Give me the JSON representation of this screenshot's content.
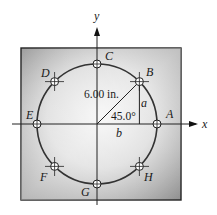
{
  "diagram": {
    "type": "bolt-circle plate",
    "axes": {
      "x_label": "x",
      "y_label": "y"
    },
    "radius_label": "6.00 in.",
    "angle_label": "45.0°",
    "leg_labels": {
      "vertical": "a",
      "horizontal": "b"
    },
    "holes": [
      {
        "id": "A",
        "angle_deg": 0
      },
      {
        "id": "B",
        "angle_deg": 45
      },
      {
        "id": "C",
        "angle_deg": 90
      },
      {
        "id": "D",
        "angle_deg": 135
      },
      {
        "id": "E",
        "angle_deg": 180
      },
      {
        "id": "F",
        "angle_deg": 225
      },
      {
        "id": "G",
        "angle_deg": 270
      },
      {
        "id": "H",
        "angle_deg": 315
      }
    ],
    "colors": {
      "plate_light": "#f2f2f2",
      "plate_dark": "#8a8a8a",
      "line": "#222222"
    }
  }
}
